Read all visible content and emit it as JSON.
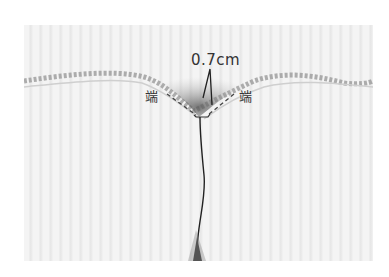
{
  "figure": {
    "type": "sewing-instruction-photo",
    "labels": {
      "measurement": "0.7cm",
      "left_end": "端",
      "right_end": "端"
    },
    "colors": {
      "fabric": "#f0f0f0",
      "stripe": "#e4e4e4",
      "seam": "#222222",
      "label_text": "#333333",
      "dashed_guide": "#444444"
    }
  }
}
